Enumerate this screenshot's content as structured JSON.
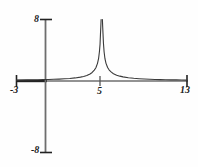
{
  "chart_data": {
    "type": "line",
    "title": "",
    "subtitle": "",
    "xlabel": "",
    "ylabel": "",
    "xlim": [
      -3,
      13
    ],
    "ylim": [
      -8,
      8
    ],
    "grid": false,
    "legend": null,
    "annotations": [],
    "axis_labels": {
      "y_max": "8",
      "y_min": "-8",
      "x_min": "-3",
      "x_max": "13",
      "x_tick": "5"
    },
    "x_ticks": [
      -3,
      5,
      13
    ],
    "y_ticks": [
      -8,
      8
    ],
    "asymptote_x": 5,
    "series": [
      {
        "name": "left-branch",
        "x": [
          -3.0,
          -2.0,
          -1.0,
          -0.5,
          0.0,
          0.5,
          1.0,
          1.5,
          2.0,
          2.5,
          3.0,
          3.3,
          3.6,
          3.9,
          4.1,
          4.3,
          4.45,
          4.6,
          4.7,
          4.78,
          4.84,
          4.88,
          4.91,
          4.94
        ],
        "y": [
          0.12,
          0.14,
          0.17,
          0.19,
          0.2,
          0.22,
          0.25,
          0.29,
          0.33,
          0.4,
          0.5,
          0.59,
          0.71,
          0.91,
          1.11,
          1.41,
          1.73,
          2.3,
          2.9,
          3.8,
          4.8,
          6.1,
          7.0,
          8.0
        ]
      },
      {
        "name": "right-branch",
        "x": [
          5.06,
          5.09,
          5.12,
          5.16,
          5.22,
          5.3,
          5.4,
          5.55,
          5.7,
          5.9,
          6.1,
          6.4,
          6.7,
          7.0,
          7.5,
          8.0,
          8.5,
          9.0,
          9.5,
          10.0,
          10.5,
          11.0,
          11.5,
          12.0,
          12.5,
          13.0
        ],
        "y": [
          8.0,
          7.0,
          6.1,
          4.9,
          3.8,
          2.9,
          2.3,
          1.75,
          1.42,
          1.15,
          0.95,
          0.76,
          0.63,
          0.54,
          0.43,
          0.35,
          0.3,
          0.26,
          0.23,
          0.2,
          0.18,
          0.16,
          0.15,
          0.14,
          0.13,
          0.12
        ]
      }
    ]
  },
  "colors": {
    "curve": "#3a3a3a",
    "axis": "#6e6e6e",
    "axis_bold": "#222222",
    "text": "#1a1a1a",
    "background": "#fefefe"
  }
}
